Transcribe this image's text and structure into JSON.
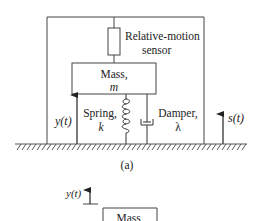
{
  "figure_a": {
    "sensor_label_line1": "Relative-motion",
    "sensor_label_line2": "sensor",
    "mass_label_line1": "Mass,",
    "mass_label_line2": "m",
    "spring_label_line1": "Spring,",
    "spring_label_line2": "k",
    "damper_label_line1": "Damper,",
    "damper_label_line2": "λ",
    "y_label": "y(t)",
    "s_label": "s(t)",
    "caption": "(a)"
  },
  "figure_b": {
    "y_label": "y(t)",
    "mass_label_line1": "Mass,"
  },
  "colors": {
    "line": "#333333",
    "text": "#222222",
    "background": "#ffffff"
  }
}
